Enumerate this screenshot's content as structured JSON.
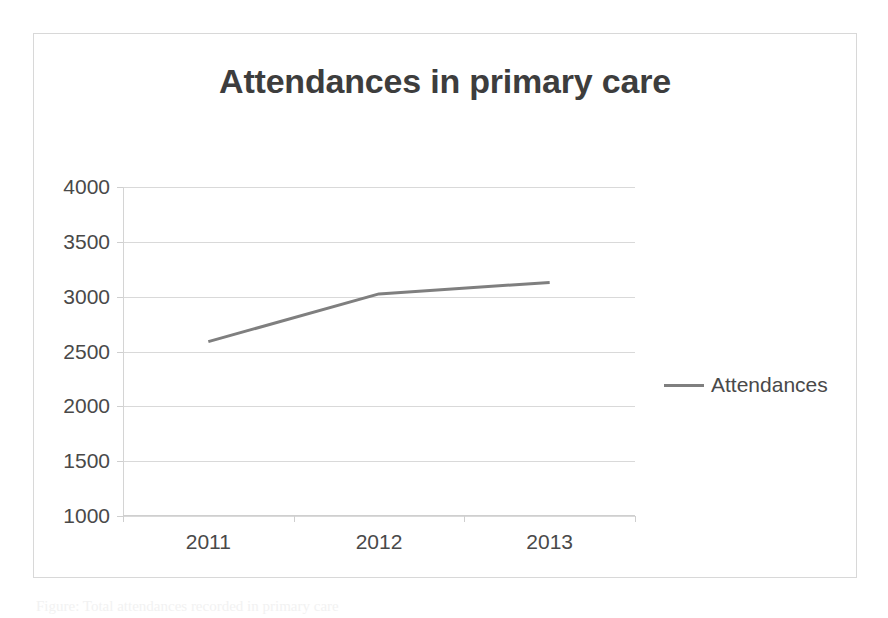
{
  "figure": {
    "title": "Attendances in primary care",
    "caption_fragment": "Figure: Total attendances recorded in primary care"
  },
  "legend": {
    "position": "right",
    "entries": [
      {
        "label": "Attendances",
        "color": "#7f7f7f",
        "marker": "line-swatch"
      }
    ]
  },
  "colors": {
    "series_line": "#7f7f7f",
    "gridline": "#d9d9d9",
    "axis": "#cfcfcf",
    "title_text": "#3d3d3d",
    "tick_text": "#494949",
    "frame_border": "#d8d8d8",
    "background": "#ffffff"
  },
  "chart_data": {
    "type": "line",
    "title": "Attendances in primary care",
    "xlabel": "",
    "ylabel": "",
    "categories": [
      "2011",
      "2012",
      "2013"
    ],
    "x": [
      "2011",
      "2012",
      "2013"
    ],
    "series": [
      {
        "name": "Attendances",
        "values": [
          2590,
          3025,
          3130
        ],
        "color": "#7f7f7f"
      }
    ],
    "ylim": [
      1000,
      4000
    ],
    "ytick_values": [
      1000,
      1500,
      2000,
      2500,
      3000,
      3500,
      4000
    ],
    "ytick_labels": [
      "1000",
      "1500",
      "2000",
      "2500",
      "3000",
      "3500",
      "4000"
    ],
    "xtick_labels": [
      "2011",
      "2012",
      "2013"
    ],
    "grid": "horizontal",
    "legend_position": "right",
    "markers": false
  }
}
